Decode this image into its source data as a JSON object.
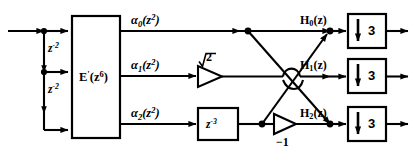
{
  "diagram": {
    "width": 413,
    "height": 153,
    "background": "#ffffff",
    "stroke": "#000000"
  },
  "input": {
    "delay_1_label": "z",
    "delay_1_exp": "-2",
    "delay_2_label": "z",
    "delay_2_exp": "-2"
  },
  "polyphase_block": {
    "name": "E",
    "prime": "'",
    "arg_base": "(z",
    "arg_exp": "6",
    "arg_close": ")"
  },
  "outputs": [
    {
      "sym": "α",
      "sub": "0",
      "arg": "(z",
      "exp": "2",
      "close": ")"
    },
    {
      "sym": "α",
      "sub": "1",
      "arg": "(z",
      "exp": "2",
      "close": ")"
    },
    {
      "sym": "α",
      "sub": "2",
      "arg": "(z",
      "exp": "2",
      "close": ")"
    }
  ],
  "multipliers": {
    "sqrt2": "√2",
    "sqrt2_radicand": "2",
    "negative_one": "−1"
  },
  "delay_block": {
    "base": "z",
    "exp": "-3"
  },
  "channels": [
    {
      "name": "H",
      "sub": "0",
      "arg": "(z)",
      "decim_factor": "3"
    },
    {
      "name": "H",
      "sub": "1",
      "arg": "(z)",
      "decim_factor": "3"
    },
    {
      "name": "H",
      "sub": "2",
      "arg": "(z)",
      "decim_factor": "3"
    }
  ],
  "decimator": {
    "arrow_glyph": "↓"
  }
}
